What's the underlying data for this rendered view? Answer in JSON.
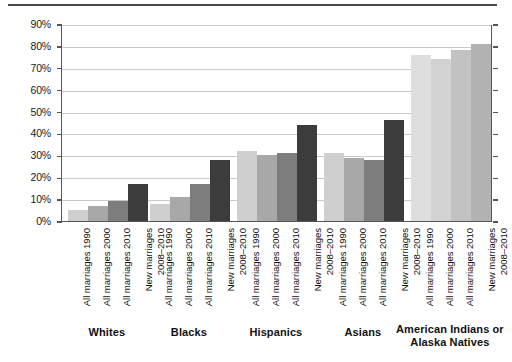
{
  "chart_data": {
    "type": "bar",
    "title": "",
    "subtitle": "",
    "xlabel": "",
    "ylabel": "",
    "ylim": [
      0,
      90
    ],
    "grid": true,
    "legend_position": "none",
    "ytick_labels": [
      "0%",
      "10%",
      "20%",
      "30%",
      "40%",
      "50%",
      "60%",
      "70%",
      "80%",
      "90%"
    ],
    "ytick_values": [
      0,
      10,
      20,
      30,
      40,
      50,
      60,
      70,
      80,
      90
    ],
    "categories": [
      "All marriages 1990",
      "All marriages 2000",
      "All marriages 2010",
      "New marriages 2008–2010"
    ],
    "groups": [
      {
        "name": "Whites",
        "values": [
          5,
          7,
          9,
          17
        ]
      },
      {
        "name": "Blacks",
        "values": [
          8,
          11,
          17,
          28
        ]
      },
      {
        "name": "Hispanics",
        "values": [
          32,
          30,
          31,
          44
        ]
      },
      {
        "name": "Asians",
        "values": [
          31,
          29,
          28,
          46
        ]
      },
      {
        "name": "American Indians or Alaska Natives",
        "values": [
          76,
          74,
          78,
          81
        ]
      }
    ],
    "series_colors": [
      "#cfcfcf",
      "#a8a8a8",
      "#7d7d7d",
      "#3c3c3c"
    ],
    "series_colors_light_group": [
      "#dedede",
      "#d2d2d2",
      "#c2c2c2",
      "#b2b2b2"
    ],
    "axis_color": "#555555",
    "grid_color": "#c9c9c9"
  },
  "group_label_lines": {
    "whites": [
      "Whites"
    ],
    "blacks": [
      "Blacks"
    ],
    "hispanics": [
      "Hispanics"
    ],
    "asians": [
      "Asians"
    ],
    "american_indians": [
      "American Indians or",
      "Alaska Natives"
    ]
  }
}
